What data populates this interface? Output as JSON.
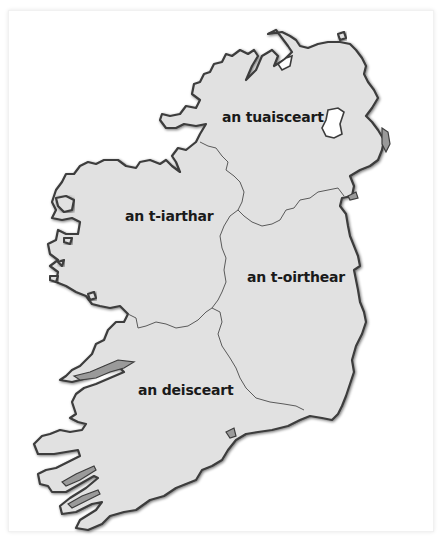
{
  "map": {
    "subject": "Ireland provinces",
    "colors": {
      "land": "#e1e1e1",
      "outline": "#3c3c3c",
      "border": "#5a5a5a",
      "label": "#1a1a1a",
      "background": "#ffffff"
    },
    "regions": [
      {
        "id": "north",
        "label": "an tuaisceart"
      },
      {
        "id": "west",
        "label": "an t-iarthar"
      },
      {
        "id": "east",
        "label": "an t-oirthear"
      },
      {
        "id": "south",
        "label": "an deisceart"
      }
    ]
  }
}
